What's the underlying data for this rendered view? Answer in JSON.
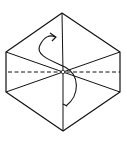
{
  "diagram": {
    "type": "origami-fold-diagram",
    "shape": "hexagon",
    "stroke_color": "#111111",
    "background": "#ffffff",
    "vertices": {
      "top": [
        62,
        13
      ],
      "upper_right": [
        120,
        52
      ],
      "lower_right": [
        120,
        92
      ],
      "bottom": [
        63,
        131
      ],
      "lower_left": [
        6,
        92
      ],
      "upper_left": [
        6,
        52
      ]
    },
    "center": [
      63,
      72
    ],
    "lines": {
      "valley_fold": "dashed horizontal line through center",
      "creases": "solid lines from center to vertices"
    },
    "arrow": "curved S-shaped fold arrow through center"
  }
}
